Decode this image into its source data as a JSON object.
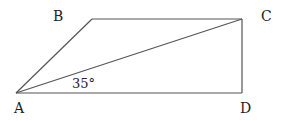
{
  "diagram": {
    "type": "geometry",
    "points": {
      "A": {
        "label": "A",
        "x": 16,
        "y": 93
      },
      "B": {
        "label": "B",
        "x": 92,
        "y": 19
      },
      "C": {
        "label": "C",
        "x": 242,
        "y": 19
      },
      "D": {
        "label": "D",
        "x": 242,
        "y": 93
      }
    },
    "edges": [
      [
        "A",
        "B"
      ],
      [
        "B",
        "C"
      ],
      [
        "C",
        "D"
      ],
      [
        "D",
        "A"
      ],
      [
        "A",
        "C"
      ]
    ],
    "angle_label": {
      "text": "35°",
      "at": "A",
      "between": [
        "AD",
        "AC"
      ]
    }
  }
}
